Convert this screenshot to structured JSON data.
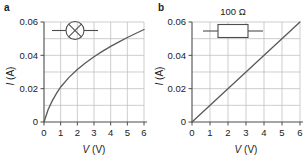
{
  "figure": {
    "panels": [
      {
        "letter": "a",
        "component_symbol": "lamp-icon",
        "component_label": "",
        "chart_data": {
          "type": "line",
          "title": "",
          "xlabel": "V (V)",
          "ylabel": "I (A)",
          "xlabel_symbol": "V",
          "xlabel_unit": "(V)",
          "ylabel_symbol": "I",
          "ylabel_unit": "(A)",
          "xlim": [
            0,
            6
          ],
          "ylim": [
            0,
            0.06
          ],
          "xticks": [
            "0",
            "1",
            "2",
            "3",
            "4",
            "5",
            "6"
          ],
          "xtick_values": [
            0,
            1,
            2,
            3,
            4,
            5,
            6
          ],
          "yticks": [
            "0",
            "0.02",
            "0.04",
            "0.06"
          ],
          "ytick_values": [
            0,
            0.02,
            0.04,
            0.06
          ],
          "grid": "minor gridlines every 1 V and every 0.01 A",
          "legend": "none",
          "series": [
            {
              "name": "filament lamp",
              "description": "non-ohmic: current rises steeply then flattens as resistance increases with temperature",
              "x": [
                0,
                0.25,
                0.5,
                0.75,
                1.0,
                1.5,
                2.0,
                2.5,
                3.0,
                3.5,
                4.0,
                4.5,
                5.0,
                5.5,
                6.0
              ],
              "y": [
                0.0,
                0.0075,
                0.0128,
                0.0172,
                0.021,
                0.0268,
                0.0315,
                0.0355,
                0.0392,
                0.0424,
                0.0454,
                0.0481,
                0.0507,
                0.0531,
                0.0555
              ]
            }
          ]
        }
      },
      {
        "letter": "b",
        "component_symbol": "resistor-icon",
        "component_label": "100 Ω",
        "chart_data": {
          "type": "line",
          "title": "",
          "xlabel": "V (V)",
          "ylabel": "I (A)",
          "xlabel_symbol": "V",
          "xlabel_unit": "(V)",
          "ylabel_symbol": "I",
          "ylabel_unit": "(A)",
          "xlim": [
            0,
            6
          ],
          "ylim": [
            0,
            0.06
          ],
          "xticks": [
            "0",
            "1",
            "2",
            "3",
            "4",
            "5",
            "6"
          ],
          "xtick_values": [
            0,
            1,
            2,
            3,
            4,
            5,
            6
          ],
          "yticks": [
            "0",
            "0.02",
            "0.04",
            "0.06"
          ],
          "ytick_values": [
            0,
            0.02,
            0.04,
            0.06
          ],
          "grid": "minor gridlines every 1 V and every 0.01 A",
          "legend": "none",
          "series": [
            {
              "name": "100 Ω resistor",
              "description": "ohmic: straight line through origin, slope 1/100 S",
              "x": [
                0,
                1,
                2,
                3,
                4,
                5,
                6
              ],
              "y": [
                0.0,
                0.01,
                0.02,
                0.03,
                0.04,
                0.05,
                0.06
              ]
            }
          ]
        }
      }
    ],
    "colors": {
      "background": "#ffffff",
      "axis": "#4d4d4d",
      "grid": "#b3b3b3",
      "curve": "#595959",
      "text": "#1a1a1a"
    }
  }
}
